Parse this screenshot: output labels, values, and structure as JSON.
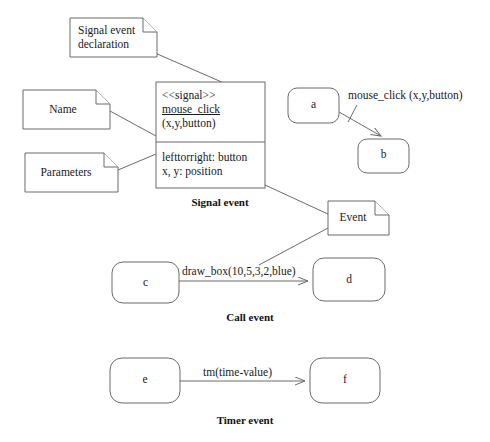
{
  "diagram": {
    "stroke_color": "#6b6b6b",
    "text_color": "#1a1a1a",
    "background": "#ffffff"
  },
  "notes": {
    "signal_event_declaration": "Signal event\ndeclaration",
    "name": "Name",
    "parameters": "Parameters",
    "event": "Event"
  },
  "signal_class": {
    "stereotype": "<<signal>>",
    "name": "mouse_click",
    "signature": "(x,y,button)",
    "attributes": [
      "lefttorright: button",
      "x, y: position"
    ]
  },
  "captions": {
    "signal_event": "Signal event",
    "call_event": "Call event",
    "timer_event": "Timer event"
  },
  "signal_example": {
    "source_node": "a",
    "target_node": "b",
    "edge_label": "mouse_click (x,y,button)"
  },
  "call_example": {
    "source_node": "c",
    "target_node": "d",
    "edge_label": "draw_box(10,5,3,2,blue)"
  },
  "timer_example": {
    "source_node": "e",
    "target_node": "f",
    "edge_label": "tm(time-value)"
  }
}
